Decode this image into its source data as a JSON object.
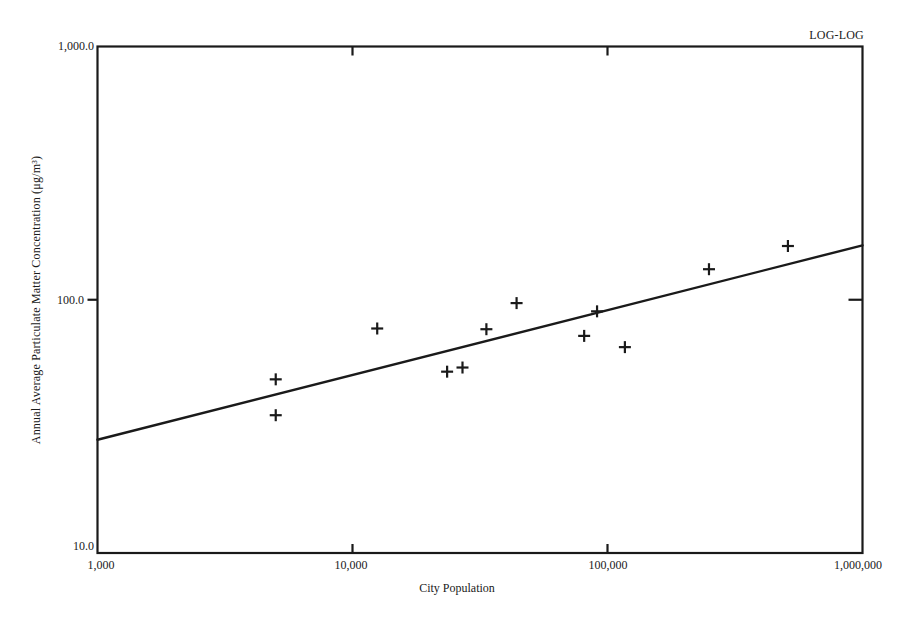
{
  "chart": {
    "tag": "LOG-LOG",
    "x_title": "City Population",
    "y_title": "Annual Average Particulate Matter Concentration (μg/m³)",
    "x_ticks": [
      "1,000",
      "10,000",
      "100,000",
      "1,000,000"
    ],
    "y_ticks": [
      "1,000.0",
      "100.0",
      "10.0"
    ]
  },
  "colors": {
    "ink": "#1a1a1a",
    "background": "#ffffff"
  },
  "chart_data": {
    "type": "scatter",
    "title": "",
    "annotation": "LOG-LOG",
    "xlabel": "City Population",
    "ylabel": "Annual Average Particulate Matter Concentration (μg/m³)",
    "xscale": "log",
    "yscale": "log",
    "xlim": [
      1000,
      1000000
    ],
    "ylim": [
      10,
      1000
    ],
    "x_tick_labels": [
      "1,000",
      "10,000",
      "100,000",
      "1,000,000"
    ],
    "y_tick_labels": [
      "10.0",
      "100.0",
      "1,000.0"
    ],
    "grid": false,
    "legend": null,
    "marker": "+",
    "series": [
      {
        "name": "Cities",
        "points": [
          {
            "x": 5000,
            "y": 48.5
          },
          {
            "x": 5000,
            "y": 35
          },
          {
            "x": 12500,
            "y": 77
          },
          {
            "x": 23500,
            "y": 52
          },
          {
            "x": 27000,
            "y": 54
          },
          {
            "x": 33500,
            "y": 76.5
          },
          {
            "x": 44000,
            "y": 97
          },
          {
            "x": 81000,
            "y": 72
          },
          {
            "x": 91000,
            "y": 90
          },
          {
            "x": 117000,
            "y": 65
          },
          {
            "x": 250000,
            "y": 132
          },
          {
            "x": 510000,
            "y": 163
          }
        ]
      }
    ],
    "fit_line": {
      "name": "Regression line",
      "points": [
        {
          "x": 1000,
          "y": 28
        },
        {
          "x": 1000000,
          "y": 164
        }
      ]
    }
  }
}
